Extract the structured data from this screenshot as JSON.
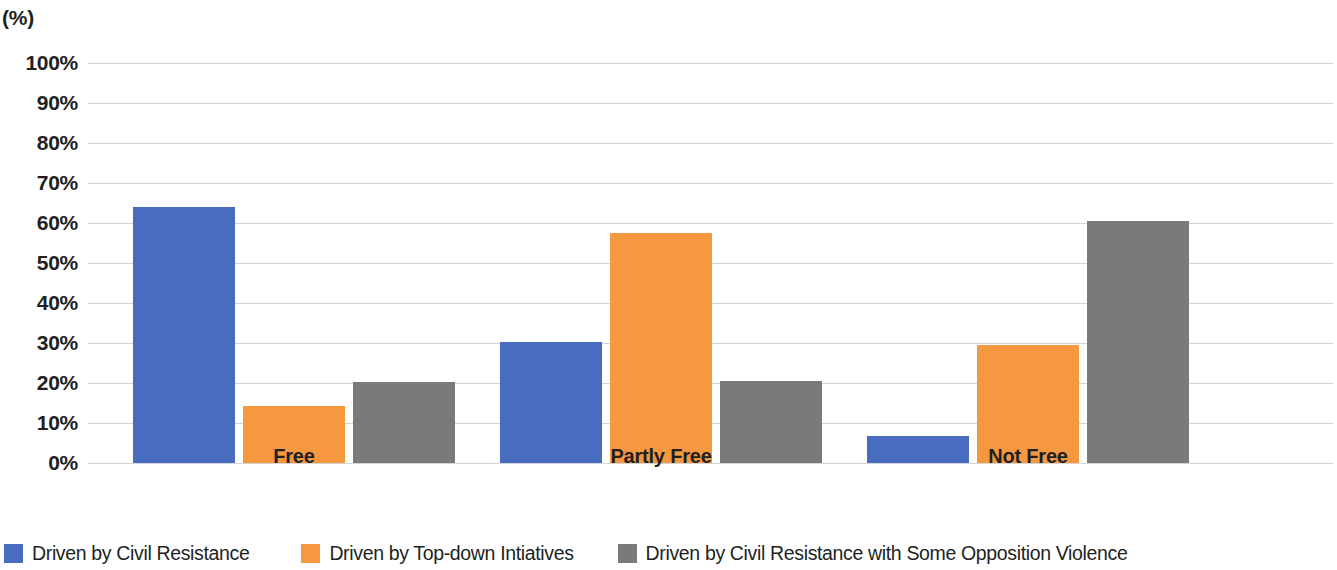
{
  "chart_data": {
    "type": "bar",
    "title": "",
    "subtitle": "",
    "unit_label": "(%)",
    "xlabel": "",
    "ylabel": "",
    "categories": [
      "Free",
      "Partly Free",
      "Not Free"
    ],
    "series": [
      {
        "name": "Driven by Civil Resistance",
        "color": "#4a6cc0",
        "values": [
          64.0,
          30.3,
          6.7
        ]
      },
      {
        "name": "Driven by Top-down Intiatives",
        "color": "#f5983f",
        "values": [
          14.3,
          57.5,
          29.5
        ]
      },
      {
        "name": "Driven by Civil Resistance with Some Opposition Violence",
        "color": "#7a7a78",
        "values": [
          20.2,
          20.4,
          60.5
        ]
      }
    ],
    "ylim": [
      0,
      100
    ],
    "ytick_values": [
      100,
      90,
      80,
      70,
      60,
      50,
      40,
      30,
      20,
      10,
      0
    ],
    "ytick_labels": [
      "100%",
      "90%",
      "80%",
      "70%",
      "60%",
      "50%",
      "40%",
      "30%",
      "20%",
      "10%",
      "0%"
    ],
    "grid": true,
    "grid_axis": "y",
    "grid_color": "#d4d4d4",
    "legend_position": "bottom",
    "background_color": "#ffffff",
    "text_color": "#221f1f"
  }
}
